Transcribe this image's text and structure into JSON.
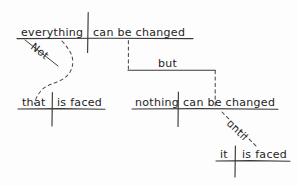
{
  "diagram": {
    "style": "handwritten-pencil",
    "ink_color": "#3a3a3a",
    "background_color": "#fdfdfd",
    "sentence": "Not everything that is faced can be changed, but nothing can be changed until it is faced.",
    "clauses": {
      "main_top": {
        "subject": "everything",
        "predicate": "can be changed"
      },
      "modifier_top": {
        "word": "Not"
      },
      "relative_left": {
        "subject": "that",
        "predicate": "is faced"
      },
      "conjunction": {
        "word": "but"
      },
      "main_bottom": {
        "subject": "nothing",
        "predicate": "can be changed"
      },
      "subordinator": {
        "word": "until"
      },
      "subordinate_bottom": {
        "subject": "it",
        "predicate": "is faced"
      }
    }
  }
}
